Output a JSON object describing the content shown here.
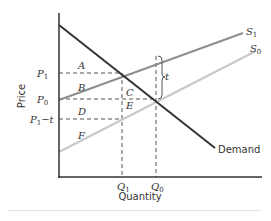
{
  "diagram": {
    "type": "supply-demand-tax",
    "axes": {
      "x_label": "Quantity",
      "y_label": "Price"
    },
    "price_levels": [
      {
        "id": "P1",
        "label": "P",
        "sub": "1",
        "y": 73
      },
      {
        "id": "P0",
        "label": "P",
        "sub": "0",
        "y": 99
      },
      {
        "id": "P1t",
        "label": "P",
        "sub": "1",
        "suffix": "−t",
        "y": 119
      }
    ],
    "quantity_levels": [
      {
        "id": "Q1",
        "label": "Q",
        "sub": "1",
        "x": 122
      },
      {
        "id": "Q0",
        "label": "Q",
        "sub": "0",
        "x": 156
      }
    ],
    "curves": [
      {
        "id": "demand",
        "label": "Demand",
        "color": "#333333",
        "from": [
          59,
          25
        ],
        "to": [
          215,
          148
        ]
      },
      {
        "id": "S1",
        "label": "S",
        "sub": "1",
        "color": "#8a8a8a",
        "from": [
          59,
          100
        ],
        "to": [
          243,
          33
        ]
      },
      {
        "id": "S0",
        "label": "S",
        "sub": "0",
        "color": "#c4c4c4",
        "from": [
          59,
          152
        ],
        "to": [
          256,
          51
        ]
      }
    ],
    "areas": [
      {
        "label": "A",
        "x": 78,
        "y": 69
      },
      {
        "label": "B",
        "x": 78,
        "y": 91
      },
      {
        "label": "C",
        "x": 126,
        "y": 96
      },
      {
        "label": "D",
        "x": 78,
        "y": 115
      },
      {
        "label": "E",
        "x": 126,
        "y": 109
      },
      {
        "label": "F",
        "x": 78,
        "y": 139
      }
    ],
    "tax_bracket": {
      "label": "t",
      "x": 162
    }
  }
}
